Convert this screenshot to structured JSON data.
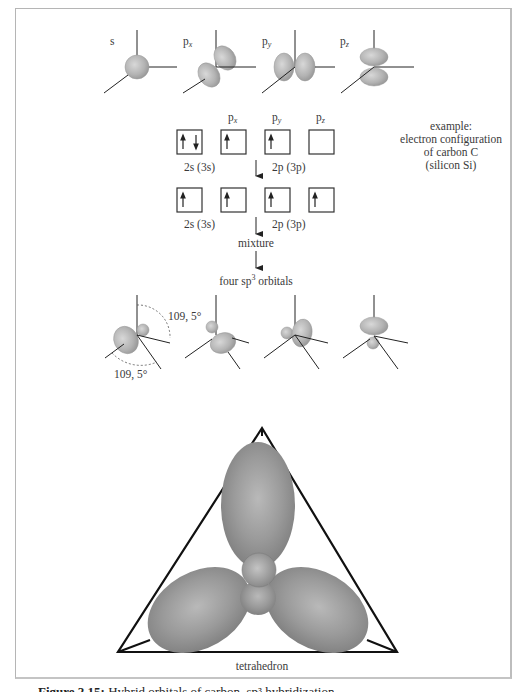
{
  "figure": {
    "top_row": {
      "orbitals": [
        {
          "label": "s",
          "subscript": ""
        },
        {
          "label": "p",
          "subscript": "x"
        },
        {
          "label": "p",
          "subscript": "y"
        },
        {
          "label": "p",
          "subscript": "z"
        }
      ]
    },
    "configuration": {
      "p_headers": [
        {
          "label": "p",
          "subscript": "x"
        },
        {
          "label": "p",
          "subscript": "y"
        },
        {
          "label": "p",
          "subscript": "z"
        }
      ],
      "ground_state": {
        "boxes": [
          "↑↓",
          "↑",
          "↑",
          ""
        ],
        "label_s": "2s (3s)",
        "label_p": "2p (3p)"
      },
      "excited_state": {
        "boxes": [
          "↑",
          "↑",
          "↑",
          "↑"
        ],
        "label_s": "2s (3s)",
        "label_p": "2p (3p)"
      },
      "example_lines": [
        "example:",
        "electron configuration",
        "of carbon C",
        "(silicon Si)"
      ]
    },
    "mixture_label": "mixture",
    "result_label_prefix": "four sp",
    "result_label_sup": "3",
    "result_label_suffix": " orbitals",
    "sp3_row": {
      "angle_label_top": "109, 5°",
      "angle_label_bottom": "109, 5°"
    },
    "tetrahedron_label": "tetrahedron",
    "caption": {
      "prefix": "Figure 2.15:",
      "text": " Hybrid orbitals of carbon, sp³ hybridization"
    },
    "colors": {
      "orbital_fill": "#b8b8b8",
      "orbital_dark": "#8a8a8a",
      "line": "#222222",
      "frame": "#b5b5b5"
    }
  }
}
